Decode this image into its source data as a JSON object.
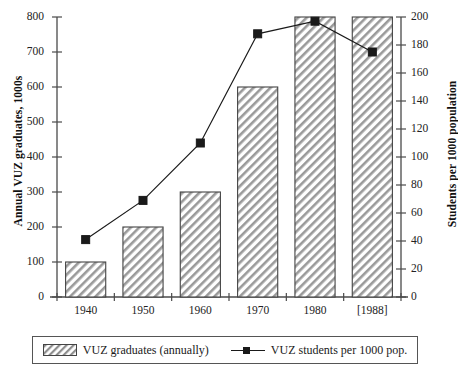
{
  "chart_data": {
    "type": "bar",
    "title": "",
    "subtitle": "",
    "categories": [
      "1940",
      "1950",
      "1960",
      "1970",
      "1980",
      "[1988]"
    ],
    "xlabel": "",
    "ylabel": "Annual VUZ graduates, 1000s",
    "ylabel_right": "Students per 1000 population",
    "ylim": [
      0,
      800
    ],
    "ylim_right": [
      0,
      200
    ],
    "yticks": [
      0,
      100,
      200,
      300,
      400,
      500,
      600,
      700,
      800
    ],
    "yticks_right": [
      0,
      20,
      40,
      60,
      80,
      100,
      120,
      140,
      160,
      180,
      200
    ],
    "grid": false,
    "legend_position": "bottom",
    "series": [
      {
        "name": "VUZ graduates (annually)",
        "type": "bar",
        "axis": "left",
        "unit": "thousands",
        "values": [
          100,
          200,
          300,
          600,
          800,
          800
        ],
        "fill": "diagonal-hatch",
        "color": "#6b6b6b"
      },
      {
        "name": "VUZ students per 1000 pop.",
        "type": "line",
        "axis": "right",
        "unit": "students per 1000 population",
        "marker": "square",
        "values": [
          41,
          69,
          110,
          188,
          197,
          175
        ],
        "color": "#1a1a1a"
      }
    ]
  },
  "axes": {
    "left_title": "Annual VUZ graduates, 1000s",
    "right_title": "Students per 1000 population",
    "left_ticks": [
      "800",
      "700",
      "600",
      "500",
      "400",
      "300",
      "200",
      "100",
      "0"
    ],
    "right_ticks": [
      "200",
      "180",
      "160",
      "140",
      "120",
      "100",
      "80",
      "60",
      "40",
      "20",
      "0"
    ],
    "x_ticks": [
      "1940",
      "1950",
      "1960",
      "1970",
      "1980",
      "[1988]"
    ]
  },
  "legend": {
    "entries": [
      {
        "label": "VUZ graduates (annually)",
        "marker": "hatched-swatch"
      },
      {
        "label": "VUZ students per 1000 pop.",
        "marker": "line-with-square"
      }
    ]
  },
  "colors": {
    "axis": "#4a4a4a",
    "line": "#1a1a1a",
    "bar_edge": "#444444",
    "hatch": "#8a8a8a",
    "background": "#ffffff"
  }
}
